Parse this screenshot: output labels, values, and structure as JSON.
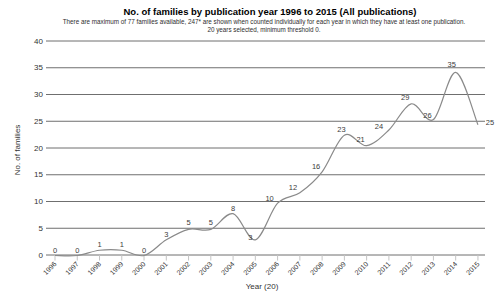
{
  "chart_data": {
    "type": "line",
    "title": "No. of families by publication year 1996 to 2015 (All publications)",
    "subtitle1": "There are maximum of 77 families available, 247* are shown when counted individually for each year in which they have at least one publication.",
    "subtitle2": "20 years selected, minimum threshold 0.",
    "x": [
      1996,
      1997,
      1998,
      1999,
      2000,
      2001,
      2002,
      2003,
      2004,
      2005,
      2006,
      2007,
      2008,
      2009,
      2010,
      2011,
      2012,
      2013,
      2014,
      2015
    ],
    "values": [
      0,
      0,
      1,
      1,
      0,
      3,
      5,
      5,
      8,
      3,
      10,
      12,
      16,
      23,
      21,
      24,
      29,
      26,
      35,
      25
    ],
    "xlabel": "Year (20)",
    "ylabel": "No. of families",
    "ylim": [
      0,
      40
    ],
    "ytick_step": 5,
    "grid": true,
    "legend": false,
    "smooth": true,
    "point_labels_visible": true,
    "colors": {
      "line": "#8a8a8a",
      "grid": "#6f6f6f",
      "tick": "#c4c4c4",
      "text": "#333333",
      "point_label": "#3c3c3c",
      "title": "#000000",
      "background": "#ffffff"
    }
  }
}
